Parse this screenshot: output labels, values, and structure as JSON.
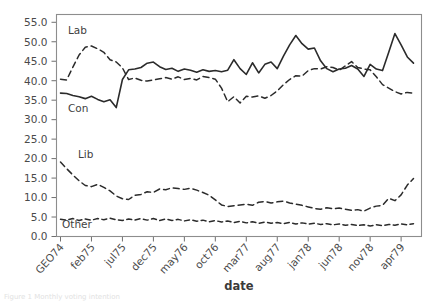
{
  "figure": {
    "caption_fragment": "Figure 1  Monthly voting intention",
    "background": "#ffffff"
  },
  "axes": {
    "xlabel": "date",
    "ylabel": "",
    "y_ticks": [
      "0.0",
      "5.0",
      "10.0",
      "15.0",
      "20.0",
      "25.0",
      "30.0",
      "35.0",
      "40.0",
      "45.0",
      "50.0",
      "55.0"
    ],
    "x_ticks": [
      "GEO74",
      "feb75",
      "jul75",
      "dec75",
      "may76",
      "oct76",
      "mar77",
      "aug77",
      "jan78",
      "jun78",
      "nov78",
      "apr79"
    ]
  },
  "annotations": [
    {
      "name": "lab",
      "text": "Lab"
    },
    {
      "name": "con",
      "text": "Con"
    },
    {
      "name": "lib",
      "text": "Lib"
    },
    {
      "name": "other",
      "text": "Other"
    }
  ],
  "chart_data": {
    "type": "line",
    "title": "",
    "xlabel": "date",
    "ylabel": "",
    "ylim": [
      0.0,
      57.0
    ],
    "grid": false,
    "legend": "inline-annotations",
    "line_color": "#2b2b2b",
    "x_tick_labels": [
      "GEO74",
      "feb75",
      "jul75",
      "dec75",
      "may76",
      "oct76",
      "mar77",
      "aug77",
      "jan78",
      "jun78",
      "nov78",
      "apr79"
    ],
    "x_tick_indices": [
      0,
      5,
      10,
      15,
      20,
      25,
      30,
      35,
      40,
      45,
      50,
      55
    ],
    "x": [
      "GEO74",
      "oct74",
      "nov74",
      "dec74",
      "jan75",
      "feb75",
      "mar75",
      "apr75",
      "may75",
      "jun75",
      "jul75",
      "aug75",
      "sep75",
      "oct75",
      "nov75",
      "dec75",
      "jan76",
      "feb76",
      "mar76",
      "apr76",
      "may76",
      "jun76",
      "jul76",
      "aug76",
      "sep76",
      "oct76",
      "nov76",
      "dec76",
      "jan77",
      "feb77",
      "mar77",
      "apr77",
      "may77",
      "jun77",
      "jul77",
      "aug77",
      "sep77",
      "oct77",
      "nov77",
      "dec77",
      "jan78",
      "feb78",
      "mar78",
      "apr78",
      "may78",
      "jun78",
      "jul78",
      "aug78",
      "sep78",
      "oct78",
      "nov78",
      "dec78",
      "jan79",
      "feb79",
      "mar79",
      "apr79",
      "may79",
      "jun79"
    ],
    "series": [
      {
        "name": "Con",
        "style": "solid",
        "values": [
          36.8,
          36.7,
          36.2,
          35.9,
          35.4,
          36.0,
          35.2,
          34.6,
          35.1,
          33.1,
          40.3,
          42.8,
          43.0,
          43.4,
          44.5,
          44.8,
          43.6,
          42.9,
          43.2,
          42.4,
          43.0,
          42.7,
          42.2,
          42.8,
          42.4,
          42.6,
          42.3,
          42.7,
          45.4,
          43.1,
          41.6,
          44.6,
          42.0,
          44.2,
          44.8,
          43.1,
          46.3,
          49.2,
          51.6,
          49.5,
          48.1,
          48.4,
          45.1,
          43.1,
          42.3,
          43.0,
          43.2,
          43.9,
          43.0,
          41.1,
          44.2,
          43.0,
          42.6,
          47.3,
          52.1,
          49.2,
          46.1,
          44.5
        ]
      },
      {
        "name": "Lab",
        "style": "dashed",
        "values": [
          40.4,
          40.2,
          43.5,
          46.6,
          48.6,
          48.9,
          48.2,
          47.3,
          45.4,
          44.8,
          43.3,
          40.3,
          40.7,
          40.1,
          39.9,
          40.2,
          40.5,
          40.8,
          40.4,
          41.0,
          40.3,
          40.6,
          40.2,
          41.1,
          40.8,
          40.4,
          38.1,
          34.6,
          35.9,
          34.3,
          36.0,
          35.8,
          36.1,
          35.5,
          36.2,
          37.4,
          39.0,
          40.3,
          41.3,
          41.2,
          42.6,
          43.1,
          43.0,
          43.6,
          43.4,
          42.7,
          43.8,
          44.9,
          43.4,
          43.0,
          42.8,
          41.0,
          39.0,
          38.1,
          37.2,
          36.6,
          37.0,
          36.8
        ]
      },
      {
        "name": "Lib",
        "style": "dashed",
        "values": [
          19.1,
          17.4,
          15.8,
          14.3,
          13.1,
          12.8,
          13.4,
          12.6,
          11.7,
          10.4,
          9.7,
          9.5,
          10.6,
          10.8,
          11.5,
          11.3,
          12.2,
          12.0,
          12.5,
          12.3,
          12.1,
          12.4,
          11.9,
          11.3,
          10.6,
          9.4,
          8.1,
          7.7,
          7.9,
          8.1,
          8.3,
          8.0,
          8.8,
          9.0,
          8.6,
          8.9,
          9.1,
          8.6,
          8.3,
          8.0,
          7.6,
          7.2,
          7.0,
          7.4,
          7.1,
          7.3,
          7.0,
          6.7,
          6.9,
          6.5,
          7.3,
          7.8,
          8.0,
          9.8,
          9.2,
          10.7,
          13.2,
          14.9
        ]
      },
      {
        "name": "Other",
        "style": "dashed",
        "values": [
          4.4,
          4.2,
          4.6,
          4.1,
          4.5,
          4.2,
          4.6,
          4.3,
          4.7,
          4.3,
          4.1,
          4.5,
          4.2,
          4.6,
          4.2,
          4.6,
          4.1,
          4.5,
          4.1,
          4.4,
          4.0,
          4.3,
          3.9,
          4.2,
          3.8,
          4.1,
          3.7,
          4.0,
          3.6,
          3.9,
          3.5,
          3.8,
          3.4,
          3.7,
          3.4,
          3.6,
          3.3,
          3.6,
          3.2,
          3.5,
          3.2,
          3.4,
          3.1,
          3.3,
          3.0,
          3.2,
          2.9,
          3.1,
          2.8,
          3.0,
          2.7,
          3.0,
          2.8,
          3.1,
          2.9,
          3.2,
          3.0,
          3.3
        ]
      }
    ]
  }
}
